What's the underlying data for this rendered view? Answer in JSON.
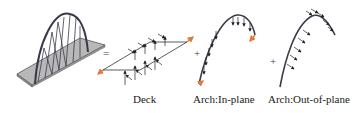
{
  "figure": {
    "type": "bridge-load-decomposition",
    "operators": {
      "equals": "=",
      "plus1": "+",
      "plus2": "+"
    },
    "panels": [
      {
        "id": "bridge",
        "label": ""
      },
      {
        "id": "deck",
        "label": "Deck"
      },
      {
        "id": "arch-in-plane",
        "label": "Arch:In-plane"
      },
      {
        "id": "arch-out-of-plane",
        "label": "Arch:Out-of-plane"
      }
    ],
    "colors": {
      "stroke": "#333344",
      "deck_fill": "#b8b8b8",
      "deck_edge": "#555555",
      "arch": "#3a3a4a",
      "arrow": "#222222",
      "force_tip": "#e07a3a"
    }
  }
}
